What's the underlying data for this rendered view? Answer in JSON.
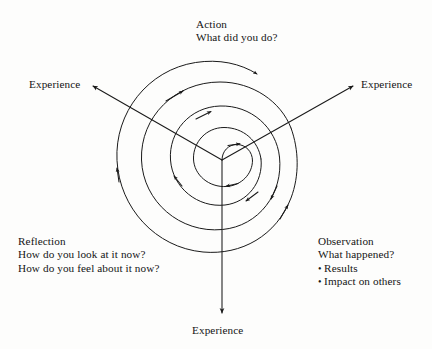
{
  "diagram": {
    "background_color": "#fdfdfc",
    "stroke_color": "#1a1a1a",
    "text_color": "#141414",
    "center": {
      "x": 222,
      "y": 160
    }
  },
  "action": {
    "heading": "Action",
    "question": "What did you do?"
  },
  "reflection": {
    "heading": "Reflection",
    "question_1": "How do you look at it now?",
    "question_2": "How do you feel about it now?"
  },
  "observation": {
    "heading": "Observation",
    "question": "What happened?",
    "bullet_marker": "•",
    "bullets": [
      "Results",
      "Impact on others"
    ]
  },
  "experience": {
    "left_label": "Experience",
    "right_label": "Experience",
    "bottom_label": "Experience"
  },
  "rays": [
    {
      "name": "experience-ray-upper-left",
      "from_x": 222,
      "from_y": 160,
      "to_x": 92,
      "to_y": 86
    },
    {
      "name": "experience-ray-upper-right",
      "from_x": 222,
      "from_y": 160,
      "to_x": 354,
      "to_y": 86
    },
    {
      "name": "experience-ray-down",
      "from_x": 222,
      "from_y": 160,
      "to_x": 222,
      "to_y": 314
    }
  ]
}
